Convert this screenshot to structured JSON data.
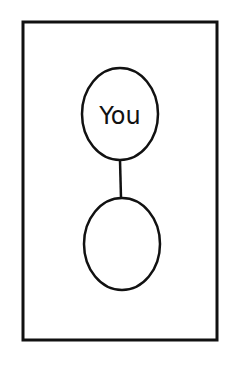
{
  "diagram": {
    "frame": {
      "x": 23,
      "y": 22,
      "width": 194,
      "height": 318
    },
    "nodes": [
      {
        "id": "top",
        "label": "You",
        "cx": 120,
        "cy": 114,
        "rx": 38,
        "ry": 46
      },
      {
        "id": "bottom",
        "label": "",
        "cx": 122,
        "cy": 244,
        "rx": 38,
        "ry": 46
      }
    ],
    "edges": [
      {
        "from": "top",
        "to": "bottom"
      }
    ],
    "colors": {
      "stroke": "#111111",
      "background": "#ffffff"
    }
  }
}
